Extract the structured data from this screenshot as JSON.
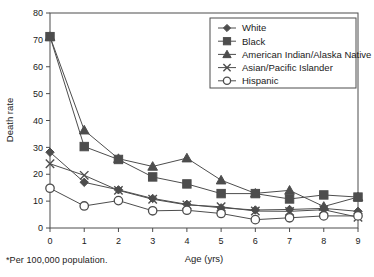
{
  "chart_data": {
    "type": "line",
    "title": "",
    "xlabel": "Age (yrs)",
    "ylabel": "Death rate",
    "xlim": [
      0,
      9
    ],
    "ylim": [
      0,
      80
    ],
    "xticks": [
      "0",
      "1",
      "2",
      "3",
      "4",
      "5",
      "6",
      "7",
      "8",
      "9"
    ],
    "yticks": [
      "0",
      "10",
      "20",
      "30",
      "40",
      "50",
      "60",
      "70",
      "80"
    ],
    "grid": false,
    "legend_position": "top-right",
    "x": [
      0,
      1,
      2,
      3,
      4,
      5,
      6,
      7,
      8,
      9
    ],
    "series": [
      {
        "name": "White",
        "marker": "filled-diamond",
        "color": "#4d4d4d",
        "values": [
          28.2,
          17.0,
          14.2,
          11.0,
          8.8,
          7.5,
          6.7,
          6.9,
          7.3,
          6.2
        ]
      },
      {
        "name": "Black",
        "marker": "filled-square",
        "color": "#4d4d4d",
        "values": [
          71.2,
          30.3,
          25.5,
          19.0,
          16.4,
          12.8,
          12.8,
          10.8,
          12.3,
          11.5
        ]
      },
      {
        "name": "American Indian/Alaska Native",
        "marker": "filled-triangle",
        "color": "#4d4d4d",
        "values": [
          71.2,
          36.4,
          25.8,
          22.9,
          26.0,
          17.8,
          12.9,
          14.0,
          8.0,
          11.5
        ]
      },
      {
        "name": "Asian/Pacific Islander",
        "marker": "cross-x",
        "color": "#4d4d4d",
        "values": [
          23.9,
          19.6,
          14.0,
          10.7,
          8.6,
          7.9,
          6.3,
          6.2,
          6.8,
          4.0
        ]
      },
      {
        "name": "Hispanic",
        "marker": "open-circle",
        "color": "#4d4d4d",
        "values": [
          14.8,
          8.2,
          10.2,
          6.4,
          6.6,
          5.4,
          3.1,
          3.8,
          4.5,
          4.5
        ]
      }
    ],
    "footnote": "*Per 100,000 population."
  },
  "axes": {
    "x_title": "Age (yrs)",
    "y_title": "Death rate"
  },
  "legend": {
    "entries": [
      "White",
      "Black",
      "American Indian/Alaska Native",
      "Asian/Pacific Islander",
      "Hispanic"
    ]
  },
  "footnote": "*Per 100,000 population.",
  "colors": {
    "line": "#4d4d4d",
    "axis": "#4d4d4d",
    "text": "#1a1a1a",
    "background": "#ffffff"
  }
}
